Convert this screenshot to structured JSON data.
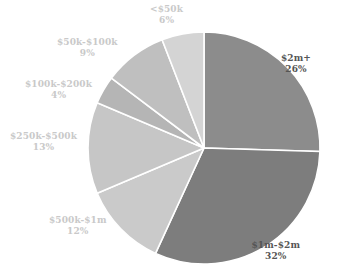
{
  "chart_data": {
    "type": "pie",
    "title": "",
    "subtitle": "",
    "xlabel": "",
    "ylabel": "",
    "grid": false,
    "legend_position": "none",
    "label_format": "name + percent",
    "start_angle_deg": 0,
    "direction": "clockwise",
    "categories": [
      "$2m+",
      "$1m-$2m",
      "$500k-$1m",
      "$250k-$500k",
      "$100k-$200k",
      "$50k-$100k",
      "<$50k"
    ],
    "values": [
      26,
      32,
      12,
      13,
      4,
      9,
      6
    ],
    "unit": "%",
    "total": 102,
    "slice_colors": [
      "#8c8c8c",
      "#7d7d7d",
      "#cacaca",
      "#c6c6c6",
      "#b5b5b5",
      "#bfbfbf",
      "#d4d4d4"
    ],
    "slice_border_color": "#ffffff",
    "slice_border_width": 1.6,
    "slices": [
      {
        "name": "$2m+",
        "value": 26,
        "display_value": "26%",
        "color": "#8c8c8c",
        "label_color": "#555555",
        "label_x": 311,
        "label_y": 53,
        "anchor": "end",
        "tone": "dark"
      },
      {
        "name": "$1m-$2m",
        "value": 32,
        "display_value": "32%",
        "color": "#7d7d7d",
        "label_color": "#555555",
        "label_x": 300,
        "label_y": 240,
        "anchor": "end",
        "tone": "dark"
      },
      {
        "name": "$500k-$1m",
        "value": 12,
        "display_value": "12%",
        "color": "#cacaca",
        "label_color": "#c9c9c9",
        "label_x": 49,
        "label_y": 215,
        "anchor": "start",
        "tone": "light"
      },
      {
        "name": "$250k-$500k",
        "value": 13,
        "display_value": "13%",
        "color": "#c6c6c6",
        "label_color": "#c9c9c9",
        "label_x": 10,
        "label_y": 131,
        "anchor": "start",
        "tone": "light"
      },
      {
        "name": "$100k-$200k",
        "value": 4,
        "display_value": "4%",
        "color": "#b5b5b5",
        "label_color": "#c9c9c9",
        "label_x": 25,
        "label_y": 79,
        "anchor": "start",
        "tone": "light"
      },
      {
        "name": "$50k-$100k",
        "value": 9,
        "display_value": "9%",
        "color": "#bfbfbf",
        "label_color": "#c9c9c9",
        "label_x": 57,
        "label_y": 37,
        "anchor": "start",
        "tone": "light"
      },
      {
        "name": "<$50k",
        "value": 6,
        "display_value": "6%",
        "color": "#d4d4d4",
        "label_color": "#c9c9c9",
        "label_x": 150,
        "label_y": 4,
        "anchor": "start",
        "tone": "light"
      }
    ],
    "geometry": {
      "center_x": 204,
      "center_y": 148,
      "radius": 116,
      "canvas_width": 337,
      "canvas_height": 278
    },
    "background_color": "#ffffff"
  }
}
